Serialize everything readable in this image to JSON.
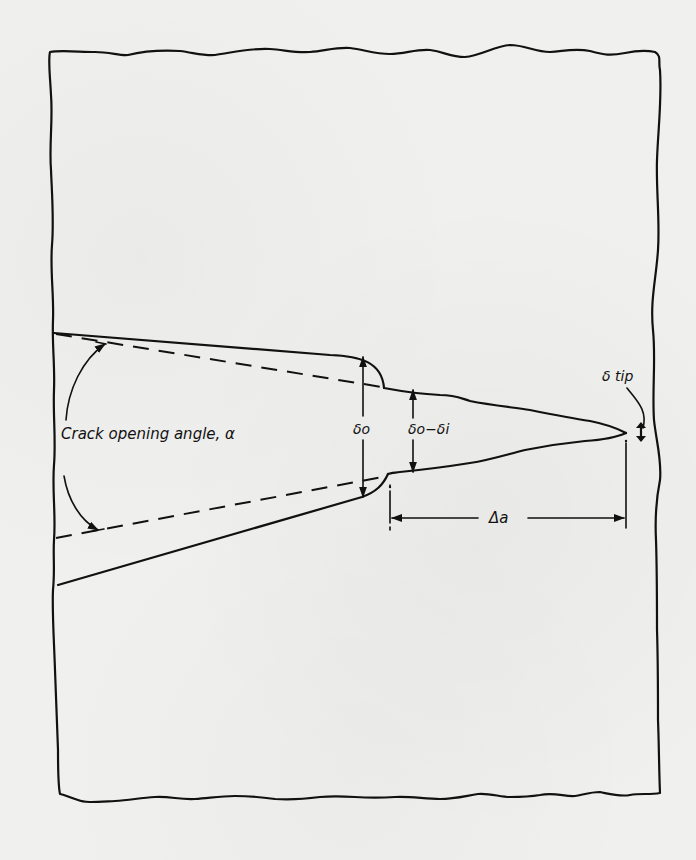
{
  "figure": {
    "type": "crack-tip-geometry-schematic",
    "labels": {
      "crack_opening_angle": "Crack opening angle, α",
      "delta_o": "δo",
      "delta_o_minus_delta_i": "δo−δi",
      "delta_tip": "δ tip",
      "delta_a": "Δa"
    },
    "elements": [
      "wavy-specimen-boundary",
      "upper-crack-flank",
      "lower-crack-flank",
      "upper-angle-dashed-line",
      "lower-angle-dashed-line",
      "angle-arc-arrow",
      "delta-o-dimension",
      "delta-o-minus-delta-i-dimension",
      "delta-a-dimension",
      "delta-tip-leader"
    ],
    "colors": {
      "ink": "#111111",
      "paper": "#f0f0ee"
    }
  }
}
